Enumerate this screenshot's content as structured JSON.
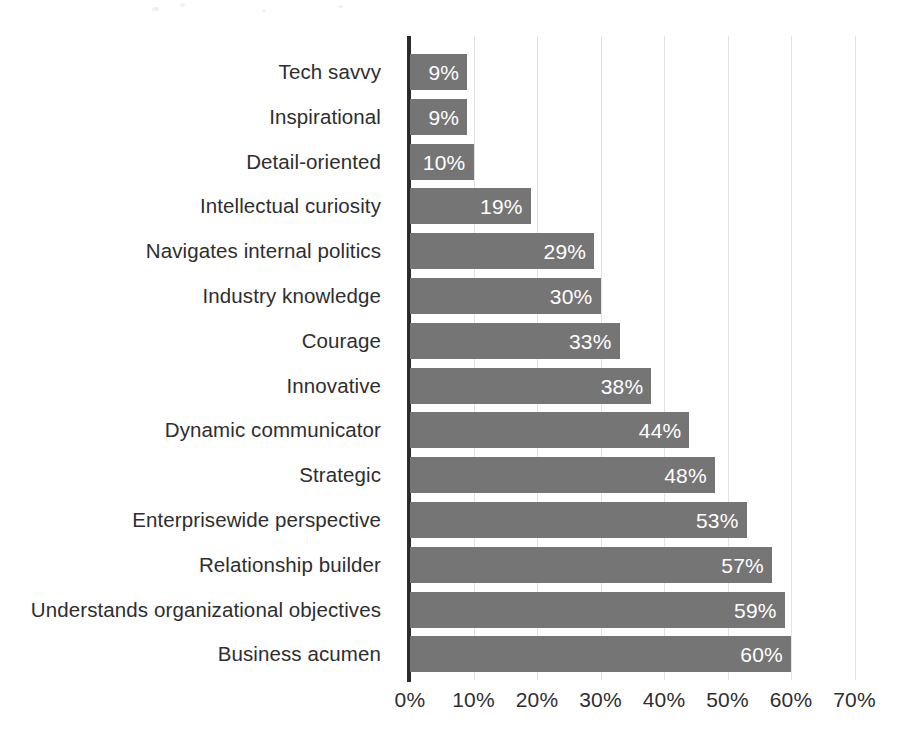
{
  "chart_data": {
    "type": "bar",
    "orientation": "horizontal",
    "title": "",
    "subtitle": "",
    "xlabel": "",
    "ylabel": "",
    "xlim": [
      0,
      70
    ],
    "grid": true,
    "legend": false,
    "value_suffix": "%",
    "bar_color": "#757575",
    "value_label_color": "#ffffff",
    "axis_color": "#2b2b2b",
    "gridline_color": "#e3e3e3",
    "background_color": "#ffffff",
    "x_ticks": [
      0,
      10,
      20,
      30,
      40,
      50,
      60,
      70
    ],
    "x_tick_labels": [
      "0%",
      "10%",
      "20%",
      "30%",
      "40%",
      "50%",
      "60%",
      "70%"
    ],
    "categories": [
      "Tech savvy",
      "Inspirational",
      "Detail-oriented",
      "Intellectual curiosity",
      "Navigates internal politics",
      "Industry knowledge",
      "Courage",
      "Innovative",
      "Dynamic communicator",
      "Strategic",
      "Enterprisewide perspective",
      "Relationship builder",
      "Understands organizational objectives",
      "Business acumen"
    ],
    "values": [
      9,
      9,
      10,
      19,
      29,
      30,
      33,
      38,
      44,
      48,
      53,
      57,
      59,
      60
    ],
    "value_labels": [
      "9%",
      "9%",
      "10%",
      "19%",
      "29%",
      "30%",
      "33%",
      "38%",
      "44%",
      "48%",
      "53%",
      "57%",
      "59%",
      "60%"
    ]
  }
}
